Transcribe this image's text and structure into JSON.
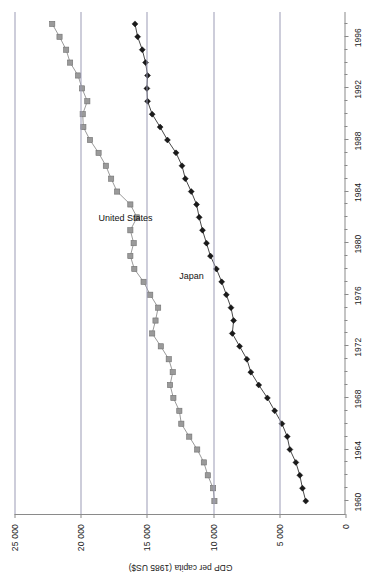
{
  "chart_data": {
    "type": "line",
    "title": "",
    "xlabel": "",
    "ylabel": "GDP per capita (1985 US$)",
    "xlim": [
      1959,
      1998
    ],
    "ylim": [
      0,
      25000
    ],
    "yticks": [
      0,
      5000,
      10000,
      15000,
      20000,
      25000
    ],
    "ytick_labels": [
      "0",
      "5 000",
      "10 000",
      "15 000",
      "20 000",
      "25 000"
    ],
    "xticks": [
      1960,
      1964,
      1968,
      1972,
      1976,
      1980,
      1984,
      1988,
      1992,
      1996
    ],
    "xtick_labels": [
      "1960",
      "1964",
      "1968",
      "1972",
      "1976",
      "1980",
      "1984",
      "1988",
      "1992",
      "1996"
    ],
    "x_minor_tick_step": 1,
    "grid": "horizontal-only",
    "legend": "inline-series-labels",
    "rotation_deg": -90,
    "x": [
      1960,
      1961,
      1962,
      1963,
      1964,
      1965,
      1966,
      1967,
      1968,
      1969,
      1970,
      1971,
      1972,
      1973,
      1974,
      1975,
      1976,
      1977,
      1978,
      1979,
      1980,
      1981,
      1982,
      1983,
      1984,
      1985,
      1986,
      1987,
      1988,
      1989,
      1990,
      1991,
      1992,
      1993,
      1994,
      1995,
      1996,
      1997
    ],
    "series": [
      {
        "name": "United States",
        "marker": "square",
        "color": "#9a9a9a",
        "line_color": "#8e8e8e",
        "values": [
          9900,
          10000,
          10400,
          10700,
          11200,
          11800,
          12400,
          12550,
          13000,
          13250,
          13050,
          13350,
          13950,
          14600,
          14350,
          14150,
          14750,
          15250,
          15950,
          16250,
          16000,
          16250,
          15750,
          16250,
          17250,
          17700,
          18100,
          18650,
          19300,
          19800,
          19850,
          19500,
          19900,
          20200,
          20800,
          21100,
          21600,
          22150
        ]
      },
      {
        "name": "Japan",
        "marker": "diamond",
        "color": "#1a1a1a",
        "line_color": "#333333",
        "values": [
          3000,
          3250,
          3450,
          3750,
          4200,
          4400,
          4800,
          5350,
          5900,
          6550,
          7150,
          7450,
          8000,
          8550,
          8450,
          8650,
          9000,
          9350,
          9750,
          10200,
          10500,
          10800,
          11050,
          11250,
          11650,
          12100,
          12350,
          12800,
          13450,
          14000,
          14600,
          14950,
          15000,
          14950,
          15100,
          15350,
          15700,
          15900
        ]
      }
    ]
  },
  "annotations": {
    "series_label_us": "United States",
    "series_label_japan": "Japan"
  },
  "caption": ""
}
